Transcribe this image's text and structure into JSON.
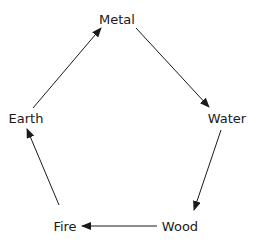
{
  "diagram": {
    "type": "cycle",
    "nodes": [
      {
        "id": "metal",
        "label": "Metal",
        "x": 117,
        "y": 19
      },
      {
        "id": "water",
        "label": "Water",
        "x": 227,
        "y": 118
      },
      {
        "id": "wood",
        "label": "Wood",
        "x": 180,
        "y": 226
      },
      {
        "id": "fire",
        "label": "Fire",
        "x": 65,
        "y": 226
      },
      {
        "id": "earth",
        "label": "Earth",
        "x": 26,
        "y": 118
      }
    ],
    "edges": [
      {
        "from": "Metal",
        "to": "Water"
      },
      {
        "from": "Water",
        "to": "Wood"
      },
      {
        "from": "Wood",
        "to": "Fire"
      },
      {
        "from": "Fire",
        "to": "Earth"
      },
      {
        "from": "Earth",
        "to": "Metal"
      }
    ],
    "colors": {
      "stroke": "#1a1a1a",
      "background": "#ffffff"
    }
  }
}
